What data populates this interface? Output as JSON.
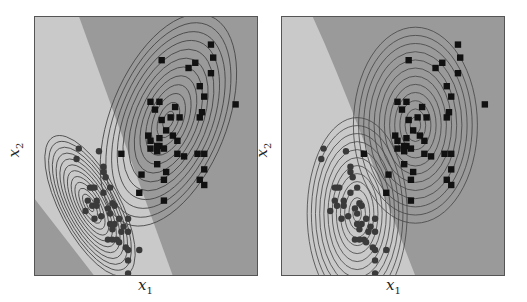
{
  "chart_data": [
    {
      "type": "scatter",
      "title": "",
      "panel": "left",
      "xlabel": "x_1",
      "ylabel": "x_2",
      "grid": false,
      "legend": null,
      "background_regions": [
        {
          "name": "class-circle-region",
          "color": "#c9c9c9",
          "shape": "diagonal band from top-left to bottom-center (linear boundaries)"
        },
        {
          "name": "class-square-region",
          "color": "#9a9a9a",
          "shape": "upper-right area and lower-left corner"
        }
      ],
      "contours": [
        {
          "class": "circle",
          "center": [
            0.25,
            0.27
          ],
          "shape": "ellipse tilted, elongated along negative-slope direction",
          "levels": 12
        },
        {
          "class": "square",
          "center": [
            0.6,
            0.6
          ],
          "shape": "ellipse tilted, elongated along positive-slope direction",
          "levels": 12
        }
      ],
      "series": [
        {
          "name": "class-square",
          "marker": "square",
          "color": "#111111",
          "points": [
            [
              0.79,
              0.89
            ],
            [
              0.8,
              0.84
            ],
            [
              0.57,
              0.83
            ],
            [
              0.72,
              0.82
            ],
            [
              0.69,
              0.8
            ],
            [
              0.79,
              0.78
            ],
            [
              0.74,
              0.73
            ],
            [
              0.76,
              0.69
            ],
            [
              0.9,
              0.66
            ],
            [
              0.52,
              0.67
            ],
            [
              0.56,
              0.67
            ],
            [
              0.54,
              0.64
            ],
            [
              0.63,
              0.65
            ],
            [
              0.57,
              0.6
            ],
            [
              0.61,
              0.61
            ],
            [
              0.65,
              0.61
            ],
            [
              0.74,
              0.61
            ],
            [
              0.75,
              0.63
            ],
            [
              0.59,
              0.56
            ],
            [
              0.51,
              0.54
            ],
            [
              0.52,
              0.52
            ],
            [
              0.56,
              0.53
            ],
            [
              0.62,
              0.54
            ],
            [
              0.64,
              0.52
            ],
            [
              0.56,
              0.5
            ],
            [
              0.55,
              0.5
            ],
            [
              0.58,
              0.49
            ],
            [
              0.55,
              0.48
            ],
            [
              0.52,
              0.49
            ],
            [
              0.64,
              0.47
            ],
            [
              0.67,
              0.46
            ],
            [
              0.73,
              0.47
            ],
            [
              0.76,
              0.47
            ],
            [
              0.39,
              0.47
            ],
            [
              0.55,
              0.43
            ],
            [
              0.59,
              0.4
            ],
            [
              0.48,
              0.39
            ],
            [
              0.58,
              0.37
            ],
            [
              0.76,
              0.41
            ],
            [
              0.74,
              0.37
            ],
            [
              0.76,
              0.35
            ],
            [
              0.47,
              0.32
            ],
            [
              0.58,
              0.29
            ]
          ]
        },
        {
          "name": "class-circle",
          "marker": "circle",
          "color": "#3a3a3a",
          "points": [
            [
              0.2,
              0.49
            ],
            [
              0.29,
              0.48
            ],
            [
              0.19,
              0.45
            ],
            [
              0.31,
              0.42
            ],
            [
              0.31,
              0.4
            ],
            [
              0.32,
              0.38
            ],
            [
              0.25,
              0.34
            ],
            [
              0.26,
              0.34
            ],
            [
              0.27,
              0.34
            ],
            [
              0.34,
              0.34
            ],
            [
              0.31,
              0.32
            ],
            [
              0.24,
              0.29
            ],
            [
              0.28,
              0.29
            ],
            [
              0.35,
              0.28
            ],
            [
              0.36,
              0.27
            ],
            [
              0.26,
              0.27
            ],
            [
              0.28,
              0.27
            ],
            [
              0.23,
              0.25
            ],
            [
              0.33,
              0.26
            ],
            [
              0.34,
              0.24
            ],
            [
              0.27,
              0.22
            ],
            [
              0.3,
              0.23
            ],
            [
              0.38,
              0.22
            ],
            [
              0.42,
              0.22
            ],
            [
              0.34,
              0.2
            ],
            [
              0.36,
              0.2
            ],
            [
              0.35,
              0.18
            ],
            [
              0.4,
              0.19
            ],
            [
              0.39,
              0.17
            ],
            [
              0.42,
              0.17
            ],
            [
              0.33,
              0.14
            ],
            [
              0.35,
              0.14
            ],
            [
              0.37,
              0.14
            ],
            [
              0.38,
              0.13
            ],
            [
              0.41,
              0.11
            ],
            [
              0.42,
              0.1
            ],
            [
              0.47,
              0.1
            ],
            [
              0.42,
              0.06
            ],
            [
              0.42,
              0.01
            ]
          ]
        }
      ]
    },
    {
      "type": "scatter",
      "title": "",
      "panel": "right",
      "xlabel": "x_1",
      "ylabel": "x_2",
      "grid": false,
      "legend": null,
      "background_regions": [
        {
          "name": "class-circle-region",
          "color": "#c9c9c9",
          "shape": "left area bounded by a curved (quadratic) boundary"
        },
        {
          "name": "class-square-region",
          "color": "#9a9a9a",
          "shape": "right area"
        }
      ],
      "contours": [
        {
          "class": "circle",
          "center": [
            0.34,
            0.24
          ],
          "shape": "axis-aligned ellipse, taller than wide",
          "levels": 12
        },
        {
          "class": "square",
          "center": [
            0.6,
            0.58
          ],
          "shape": "axis-aligned ellipse, taller than wide",
          "levels": 12
        }
      ],
      "series": [
        {
          "name": "class-square",
          "marker": "square",
          "color": "#111111",
          "points": [
            [
              0.79,
              0.89
            ],
            [
              0.8,
              0.84
            ],
            [
              0.57,
              0.83
            ],
            [
              0.72,
              0.82
            ],
            [
              0.69,
              0.8
            ],
            [
              0.79,
              0.78
            ],
            [
              0.74,
              0.73
            ],
            [
              0.76,
              0.69
            ],
            [
              0.91,
              0.66
            ],
            [
              0.52,
              0.67
            ],
            [
              0.56,
              0.67
            ],
            [
              0.54,
              0.64
            ],
            [
              0.63,
              0.65
            ],
            [
              0.57,
              0.6
            ],
            [
              0.61,
              0.61
            ],
            [
              0.65,
              0.61
            ],
            [
              0.74,
              0.61
            ],
            [
              0.75,
              0.63
            ],
            [
              0.59,
              0.56
            ],
            [
              0.51,
              0.54
            ],
            [
              0.52,
              0.52
            ],
            [
              0.56,
              0.53
            ],
            [
              0.62,
              0.54
            ],
            [
              0.64,
              0.52
            ],
            [
              0.56,
              0.5
            ],
            [
              0.55,
              0.5
            ],
            [
              0.58,
              0.49
            ],
            [
              0.55,
              0.48
            ],
            [
              0.52,
              0.49
            ],
            [
              0.64,
              0.47
            ],
            [
              0.67,
              0.46
            ],
            [
              0.73,
              0.47
            ],
            [
              0.76,
              0.47
            ],
            [
              0.37,
              0.47
            ],
            [
              0.55,
              0.43
            ],
            [
              0.59,
              0.4
            ],
            [
              0.48,
              0.39
            ],
            [
              0.58,
              0.37
            ],
            [
              0.76,
              0.41
            ],
            [
              0.74,
              0.37
            ],
            [
              0.76,
              0.35
            ],
            [
              0.47,
              0.32
            ],
            [
              0.58,
              0.29
            ]
          ]
        },
        {
          "name": "class-circle",
          "marker": "circle",
          "color": "#3a3a3a",
          "points": [
            [
              0.19,
              0.49
            ],
            [
              0.29,
              0.48
            ],
            [
              0.18,
              0.45
            ],
            [
              0.31,
              0.42
            ],
            [
              0.31,
              0.4
            ],
            [
              0.32,
              0.38
            ],
            [
              0.24,
              0.34
            ],
            [
              0.25,
              0.34
            ],
            [
              0.26,
              0.34
            ],
            [
              0.34,
              0.34
            ],
            [
              0.31,
              0.32
            ],
            [
              0.24,
              0.29
            ],
            [
              0.28,
              0.29
            ],
            [
              0.35,
              0.28
            ],
            [
              0.36,
              0.27
            ],
            [
              0.25,
              0.27
            ],
            [
              0.28,
              0.27
            ],
            [
              0.22,
              0.25
            ],
            [
              0.33,
              0.26
            ],
            [
              0.34,
              0.24
            ],
            [
              0.27,
              0.22
            ],
            [
              0.3,
              0.23
            ],
            [
              0.38,
              0.22
            ],
            [
              0.42,
              0.22
            ],
            [
              0.34,
              0.2
            ],
            [
              0.36,
              0.2
            ],
            [
              0.35,
              0.18
            ],
            [
              0.4,
              0.19
            ],
            [
              0.39,
              0.17
            ],
            [
              0.42,
              0.17
            ],
            [
              0.33,
              0.14
            ],
            [
              0.35,
              0.14
            ],
            [
              0.37,
              0.14
            ],
            [
              0.38,
              0.13
            ],
            [
              0.41,
              0.11
            ],
            [
              0.42,
              0.1
            ],
            [
              0.47,
              0.1
            ],
            [
              0.42,
              0.06
            ],
            [
              0.42,
              0.01
            ]
          ]
        }
      ]
    }
  ],
  "labels": {
    "left": {
      "x_var": "x",
      "x_sub": "1",
      "y_var": "x",
      "y_sub": "2"
    },
    "right": {
      "x_var": "x",
      "x_sub": "1",
      "y_var": "x",
      "y_sub": "2"
    }
  },
  "colors": {
    "light_region": "#c9c9c9",
    "dark_region": "#9a9a9a",
    "contour": "#444444",
    "square_marker": "#111111",
    "circle_marker": "#3a3a3a",
    "frame": "#555555"
  }
}
